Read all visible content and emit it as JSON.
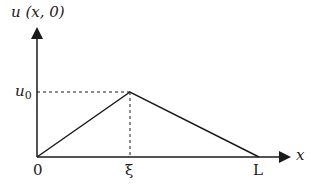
{
  "diagram": {
    "y_axis_label": "u (x, 0)",
    "x_axis_label": "x",
    "peak_label": "u",
    "peak_label_sub": "0",
    "origin_label": "0",
    "xi_label": "ξ",
    "end_label": "L",
    "colors": {
      "line": "#1a1a1a",
      "background": "#ffffff"
    },
    "points": {
      "origin": [
        37,
        157
      ],
      "peak": [
        130,
        92
      ],
      "end": [
        259,
        157
      ]
    }
  }
}
